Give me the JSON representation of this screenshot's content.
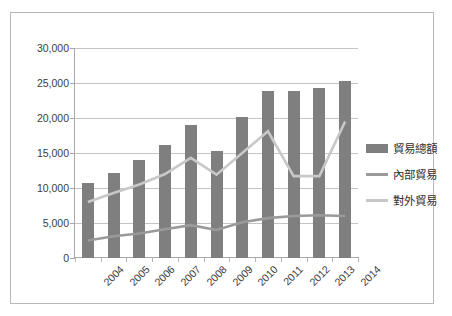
{
  "chart_data": {
    "type": "bar",
    "title": "",
    "xlabel": "",
    "ylabel": "",
    "ylim": [
      0,
      30000
    ],
    "yticks": [
      0,
      5000,
      10000,
      15000,
      20000,
      25000,
      30000
    ],
    "ytick_labels": [
      "0",
      "5,000",
      "10,000",
      "15,000",
      "20,000",
      "25,000",
      "30,000"
    ],
    "grid": true,
    "legend_position": "right",
    "categories": [
      "2004",
      "2005",
      "2006",
      "2007",
      "2008",
      "2009",
      "2010",
      "2011",
      "2012",
      "2013",
      "2014"
    ],
    "series": [
      {
        "name": "貿易總額",
        "type": "bar",
        "color": "#7f7f7f",
        "values": [
          10700,
          12200,
          14000,
          16100,
          19000,
          15300,
          20100,
          23900,
          23800,
          24300,
          25300
        ]
      },
      {
        "name": "內部貿易",
        "type": "line",
        "color": "#9a9a9a",
        "values": [
          2500,
          3100,
          3500,
          4100,
          4700,
          4000,
          5100,
          5700,
          6000,
          6100,
          6000
        ]
      },
      {
        "name": "對外貿易",
        "type": "line",
        "color": "#c8c8c8",
        "values": [
          8000,
          9300,
          10500,
          12000,
          14300,
          11900,
          15000,
          18100,
          11700,
          11700,
          19500
        ]
      }
    ]
  },
  "legend": {
    "items": [
      {
        "label": "貿易總額",
        "marker": "bar-swatch",
        "color": "#7f7f7f"
      },
      {
        "label": "內部貿易",
        "marker": "line-swatch",
        "color": "#9a9a9a"
      },
      {
        "label": "對外貿易",
        "marker": "line-swatch",
        "color": "#c8c8c8"
      }
    ]
  }
}
